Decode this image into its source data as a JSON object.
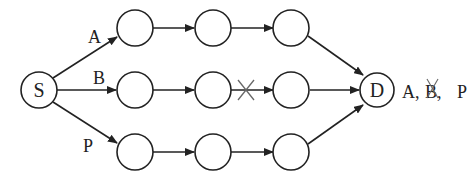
{
  "diagram": {
    "source_label": "S",
    "destination_label": "D",
    "edge_labels": {
      "A": "A",
      "B": "B",
      "P": "P"
    },
    "result_labels": [
      {
        "text": "A,",
        "crossed": false
      },
      {
        "text": "B,",
        "crossed": true
      },
      {
        "text": "P",
        "crossed": false
      }
    ],
    "paths": [
      {
        "name": "A",
        "nodes": 3,
        "blocked": false
      },
      {
        "name": "B",
        "nodes": 3,
        "blocked": true,
        "blocked_between": [
          2,
          3
        ]
      },
      {
        "name": "P",
        "nodes": 3,
        "blocked": false
      }
    ],
    "colors": {
      "stroke": "#222222",
      "cross": "#666666"
    }
  }
}
